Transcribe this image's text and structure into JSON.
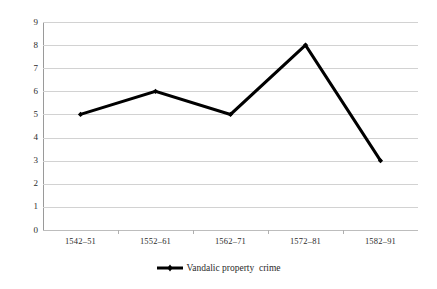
{
  "chart_data": {
    "type": "line",
    "title": "",
    "xlabel": "",
    "ylabel": "",
    "categories": [
      "1542–51",
      "1552–61",
      "1562–71",
      "1572–81",
      "1582–91"
    ],
    "values": [
      5,
      6,
      5,
      8,
      3
    ],
    "series": [
      {
        "name": "Vandalic property  crime",
        "values": [
          5,
          6,
          5,
          8,
          3
        ]
      }
    ],
    "ylim": [
      0,
      9
    ],
    "ytick_labels": [
      "0",
      "1",
      "2",
      "3",
      "4",
      "5",
      "6",
      "7",
      "8",
      "9"
    ],
    "ytick_values": [
      0,
      1,
      2,
      3,
      4,
      5,
      6,
      7,
      8,
      9
    ],
    "grid": true,
    "grid_color": "#d2d2d2",
    "legend_position": "bottom",
    "legend": [
      {
        "label": "Vandalic property  crime",
        "color": "#000000",
        "marker": "diamond",
        "swatch_icon": "line-with-marker-icon"
      }
    ],
    "line_color": "#000000",
    "background_color": "#ffffff",
    "axis_color": "#9a9a9a"
  }
}
